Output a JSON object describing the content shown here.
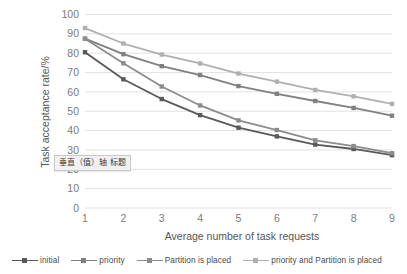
{
  "chart_data": {
    "type": "line",
    "title": "",
    "subtitle": "",
    "xlabel": "Average number of task requests",
    "ylabel": "Task acceptance rate/%",
    "x": [
      1,
      2,
      3,
      4,
      5,
      6,
      7,
      8,
      9
    ],
    "xtick_labels": [
      "1",
      "2",
      "3",
      "4",
      "5",
      "6",
      "7",
      "8",
      "9"
    ],
    "ytick_labels": [
      "0",
      "10",
      "20",
      "30",
      "40",
      "50",
      "60",
      "70",
      "80",
      "90",
      "100"
    ],
    "yticks": [
      0,
      10,
      20,
      30,
      40,
      50,
      60,
      70,
      80,
      90,
      100
    ],
    "ylim": [
      0,
      100
    ],
    "xlim": [
      1,
      9
    ],
    "grid": "horizontal",
    "legend_position": "bottom",
    "series": [
      {
        "name": "initial",
        "color": "#595959",
        "values": [
          80.5,
          66.5,
          56.3,
          48.0,
          41.5,
          37.0,
          32.8,
          30.5,
          27.3
        ]
      },
      {
        "name": "priority",
        "color": "#808080",
        "values": [
          87.5,
          79.5,
          73.3,
          68.7,
          63.0,
          59.0,
          55.3,
          51.7,
          47.7
        ]
      },
      {
        "name": "Partition is placed",
        "color": "#8c8c8c",
        "values": [
          87.5,
          74.8,
          62.8,
          53.0,
          45.3,
          40.3,
          35.0,
          32.0,
          28.3
        ]
      },
      {
        "name": "priority and Partition is placed",
        "color": "#b0b0b0",
        "values": [
          93.0,
          85.0,
          79.3,
          74.7,
          69.5,
          65.3,
          61.0,
          57.7,
          53.8
        ]
      }
    ]
  },
  "axis_titles": {
    "x": "Average number of task requests",
    "y": "Task acceptance rate/%"
  },
  "legend": {
    "items": [
      {
        "label": "initial",
        "color": "#595959"
      },
      {
        "label": "priority",
        "color": "#808080"
      },
      {
        "label": "Partition is placed",
        "color": "#8c8c8c"
      },
      {
        "label": "priority and Partition is placed",
        "color": "#b0b0b0"
      }
    ]
  },
  "overlay": {
    "axis_title_tooltip": "垂直（值）轴 标题"
  },
  "colors": {
    "gridline": "#e2e2e2",
    "tick_text": "#7b7b7b",
    "axis_title_text": "#555555",
    "plot_background": "#ffffff"
  }
}
